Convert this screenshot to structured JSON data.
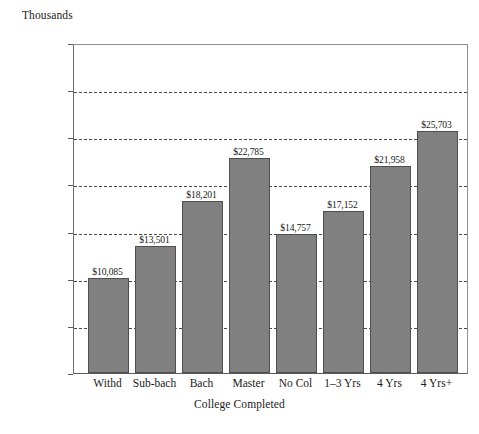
{
  "chart_data": {
    "type": "bar",
    "title": "",
    "unit_caption": "Thousands",
    "xlabel": "College Completed",
    "ylabel": "",
    "categories": [
      "Withd",
      "Sub-bach",
      "Bach",
      "Master",
      "No Col",
      "1–3 Yrs",
      "4 Yrs",
      "4 Yrs+"
    ],
    "values": [
      10085,
      13501,
      18201,
      22785,
      14757,
      17152,
      21958,
      25703
    ],
    "value_labels": [
      "$10,085",
      "$13,501",
      "$18,201",
      "$22,785",
      "$14,757",
      "$17,152",
      "$21,958",
      "$25,703"
    ],
    "ylim": [
      0,
      35000
    ],
    "y_tick_values": [
      0,
      5000,
      10000,
      15000,
      20000,
      25000,
      30000,
      35000
    ],
    "y_tick_labels": [
      "$ 0",
      "$ 5",
      "$10",
      "$15",
      "$20",
      "$25",
      "$30",
      "$35"
    ],
    "grid": true,
    "grid_style": "dashed",
    "legend": false,
    "bar_color": "#808080",
    "bar_edge_color": "#4f4f4f",
    "axis_color": "#5a5a5a",
    "background_color": "#ffffff"
  }
}
